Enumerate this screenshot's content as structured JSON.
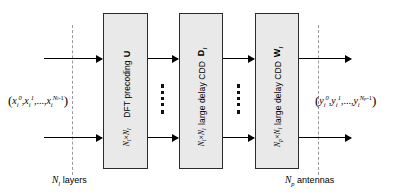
{
  "figure": {
    "type": "block-diagram"
  },
  "input": {
    "label_plain": "(x_i^0, x_i^1, ..., x_i^{N_l-1})",
    "open_paren": "(",
    "close_paren": ")",
    "term1_base": "x",
    "term1_sub": "i",
    "term1_sup": "0",
    "comma1": ",",
    "term2_base": "x",
    "term2_sub": "i",
    "term2_sup": "1",
    "ellipsis": ",...,",
    "term3_base": "x",
    "term3_sub": "i",
    "term3_sup": "N",
    "term3_sup_sub": "l",
    "term3_sup_tail": "-1"
  },
  "output": {
    "label_plain": "(y_i^0, y_i^1, ..., y_i^{N_p-1})",
    "open_paren": "(",
    "close_paren": ")",
    "term1_base": "y",
    "term1_sub": "i",
    "term1_sup": "0",
    "comma1": ",",
    "term2_base": "y",
    "term2_sub": "i",
    "term2_sup": "1",
    "ellipsis": ",...,",
    "term3_base": "y",
    "term3_sub": "i",
    "term3_sup": "N",
    "term3_sup_sub": "p",
    "term3_sup_tail": "-1"
  },
  "blocks": [
    {
      "id": "dft-precoding",
      "title": "DFT precoding",
      "matrix_symbol": "U",
      "dim_rows": "N",
      "dim_rows_sub": "l",
      "dim_times": "×",
      "dim_cols": "N",
      "dim_cols_sub": "l",
      "dim_plain": "N_l × N_l"
    },
    {
      "id": "large-delay-cdd-d",
      "title": "large delay CDD",
      "matrix_symbol": "D",
      "matrix_symbol_sub": "i",
      "dim_rows": "N",
      "dim_rows_sub": "l",
      "dim_times": "×",
      "dim_cols": "N",
      "dim_cols_sub": "l",
      "dim_plain": "N_l × N_l"
    },
    {
      "id": "large-delay-cdd-w",
      "title": "large delay CDD",
      "matrix_symbol": "W",
      "matrix_symbol_sub": "i",
      "dim_rows": "N",
      "dim_rows_sub": "p",
      "dim_times": "×",
      "dim_cols": "N",
      "dim_cols_sub": "l",
      "dim_plain": "N_p × N_l"
    }
  ],
  "captions": {
    "left_symbol": "N",
    "left_symbol_sub": "l",
    "left_text": "layers",
    "left_plain": "N_l layers",
    "right_symbol": "N",
    "right_symbol_sub": "p",
    "right_text": "antennas",
    "right_plain": "N_p antennas"
  },
  "ellipsis_markers": {
    "count": 2,
    "glyph": "vertical-dots"
  },
  "colors": {
    "block_fill": "#e9e9e9",
    "block_stroke": "#2b2b2b",
    "arrow": "#000000",
    "refline": "#9a9a9a",
    "background": "#ffffff"
  }
}
